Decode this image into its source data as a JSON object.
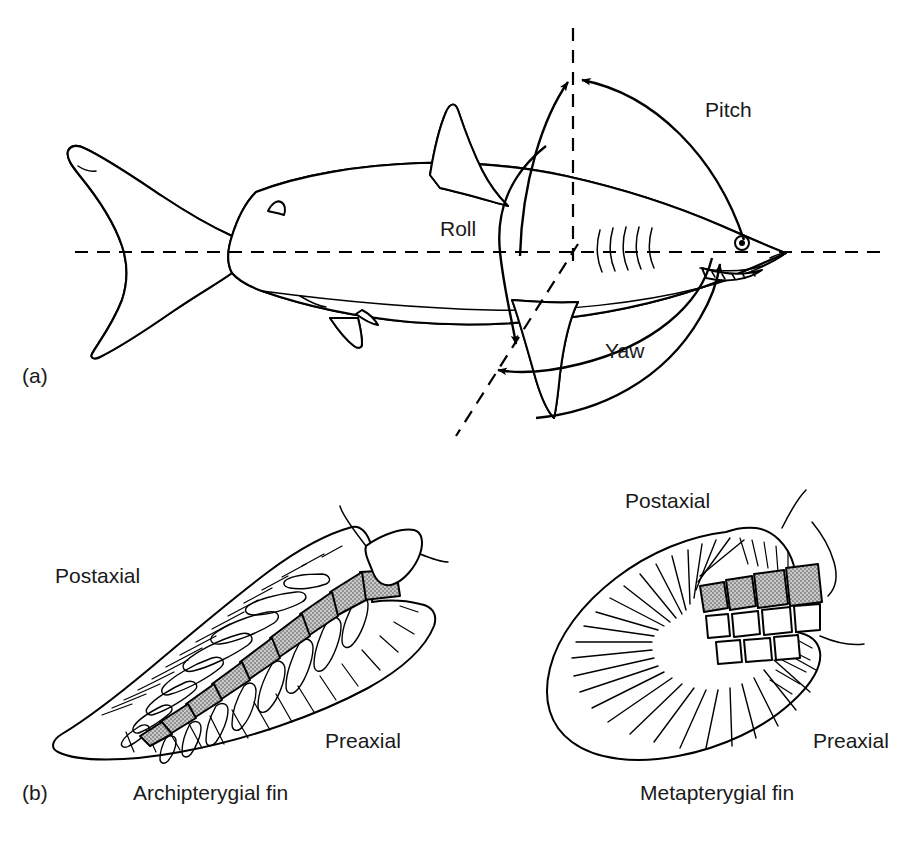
{
  "figure": {
    "background_color": "#ffffff",
    "ink_color": "#000000",
    "shaded_element_color": "#a8a8a8",
    "text_color": "#1a1a1a"
  },
  "panels": [
    {
      "letter": "(a)",
      "subject": "shark",
      "description": "Lateral view of a shark with three dashed body axes and curved double-headed arrows showing the three rotational degrees of freedom",
      "axes": [
        {
          "name": "longitudinal-axis",
          "orientation": "horizontal",
          "rotation_label": "Roll"
        },
        {
          "name": "vertical-axis",
          "orientation": "vertical",
          "rotation_label": "Pitch"
        },
        {
          "name": "transverse-axis",
          "orientation": "oblique",
          "rotation_label": "Yaw"
        }
      ],
      "rotation_labels": [
        {
          "id": "roll",
          "text": "Roll",
          "x": 440,
          "y": 236
        },
        {
          "id": "pitch",
          "text": "Pitch",
          "x": 705,
          "y": 117
        },
        {
          "id": "yaw",
          "text": "Yaw",
          "x": 605,
          "y": 358
        }
      ]
    },
    {
      "letter": "(b)",
      "subject": "paired fin skeleton types",
      "fins": [
        {
          "id": "archipterygial",
          "caption": "Archipterygial fin",
          "caption_x": 133,
          "caption_y": 800,
          "margin_labels": [
            {
              "id": "postaxial",
              "text": "Postaxial",
              "x": 55,
              "y": 583
            },
            {
              "id": "preaxial",
              "text": "Preaxial",
              "x": 325,
              "y": 748
            }
          ],
          "axis_segment_count": 8,
          "radial_count_per_side": 8
        },
        {
          "id": "metapterygial",
          "caption": "Metapterygial fin",
          "caption_x": 640,
          "caption_y": 800,
          "margin_labels": [
            {
              "id": "postaxial",
              "text": "Postaxial",
              "x": 625,
              "y": 508
            },
            {
              "id": "preaxial",
              "text": "Preaxial",
              "x": 813,
              "y": 748
            }
          ],
          "basal_element_count": 4,
          "radial_element_count": 7
        }
      ]
    }
  ],
  "panel_letters": [
    {
      "id": "panel-a-letter",
      "text": "(a)",
      "x": 22,
      "y": 383
    },
    {
      "id": "panel-b-letter",
      "text": "(b)",
      "x": 22,
      "y": 800
    }
  ]
}
